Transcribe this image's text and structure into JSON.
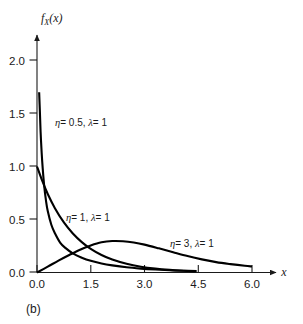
{
  "figure": {
    "caption": "(b)",
    "background_color": "#ffffff",
    "curve_color": "#000000",
    "axis_color": "#1a1a1a"
  },
  "chart_data": {
    "type": "line",
    "title": "",
    "subtitle": "",
    "xlabel": "x",
    "ylabel": "f_X(x)",
    "ylabel_base": "f",
    "ylabel_sub": "X",
    "ylabel_arg": "(x)",
    "xlim": [
      0.0,
      6.6
    ],
    "ylim": [
      0.0,
      2.25
    ],
    "xticks": [
      0.0,
      1.5,
      3.0,
      4.5,
      6.0
    ],
    "xtick_labels": [
      "0.0",
      "1.5",
      "3.0",
      "4.5",
      "6.0"
    ],
    "yticks": [
      0.0,
      0.5,
      1.0,
      1.5,
      2.0
    ],
    "ytick_labels": [
      "0.0",
      "0.5",
      "1.0",
      "1.5",
      "2.0"
    ],
    "grid": false,
    "legend": "inline-annotations",
    "axis_style": "arrow-tipped",
    "annotations": [
      {
        "name": "eta-0p5-label",
        "text": "η = 0.5, λ = 1",
        "greek": "η",
        "rest": "= 0.5, ",
        "greek2": "λ",
        "rest2": "= 1",
        "x": 0.35,
        "y": 1.28
      },
      {
        "name": "eta-1-label",
        "text": "η = 1, λ = 1",
        "greek": "η",
        "rest": "= 1, ",
        "greek2": "λ",
        "rest2": "= 1",
        "x": 0.62,
        "y": 0.52
      },
      {
        "name": "eta-3-label",
        "text": "η = 3, λ = 1",
        "greek": "η",
        "rest": "= 3, ",
        "greek2": "λ",
        "rest2": "= 1",
        "x": 3.55,
        "y": 0.26
      }
    ],
    "series": [
      {
        "name": "eta = 0.5, lambda = 1",
        "eta": 0.5,
        "lambda": 1,
        "label": "η = 0.5, λ = 1",
        "x": [
          0.06,
          0.08,
          0.1,
          0.13,
          0.16,
          0.2,
          0.25,
          0.3,
          0.4,
          0.5,
          0.65,
          0.8,
          1.0,
          1.25,
          1.5,
          1.8,
          2.1,
          2.5,
          2.9,
          3.3,
          3.7,
          4.1,
          4.45
        ],
        "y": [
          1.7,
          1.52,
          1.33,
          1.13,
          0.98,
          0.82,
          0.68,
          0.58,
          0.45,
          0.37,
          0.28,
          0.23,
          0.18,
          0.14,
          0.11,
          0.085,
          0.067,
          0.049,
          0.037,
          0.028,
          0.021,
          0.016,
          0.013
        ]
      },
      {
        "name": "eta = 1, lambda = 1",
        "eta": 1,
        "lambda": 1,
        "label": "η = 1, λ = 1",
        "x": [
          0.0,
          0.15,
          0.3,
          0.5,
          0.75,
          1.0,
          1.25,
          1.5,
          1.8,
          2.1,
          2.5,
          2.9,
          3.3,
          3.7,
          4.1,
          4.45
        ],
        "y": [
          1.0,
          0.861,
          0.741,
          0.607,
          0.472,
          0.368,
          0.287,
          0.223,
          0.165,
          0.122,
          0.082,
          0.055,
          0.037,
          0.025,
          0.017,
          0.012
        ]
      },
      {
        "name": "eta = 3, lambda = 1",
        "eta": 3,
        "lambda": 1,
        "label": "η = 3, λ = 1",
        "x": [
          0.0,
          0.3,
          0.6,
          0.9,
          1.2,
          1.5,
          1.8,
          2.1,
          2.4,
          2.7,
          3.0,
          3.4,
          3.8,
          4.2,
          4.6,
          5.0,
          5.4,
          5.8,
          6.0
        ],
        "y": [
          0.0,
          0.055,
          0.112,
          0.165,
          0.215,
          0.255,
          0.285,
          0.297,
          0.295,
          0.283,
          0.263,
          0.228,
          0.191,
          0.155,
          0.124,
          0.098,
          0.079,
          0.063,
          0.057
        ]
      }
    ]
  }
}
